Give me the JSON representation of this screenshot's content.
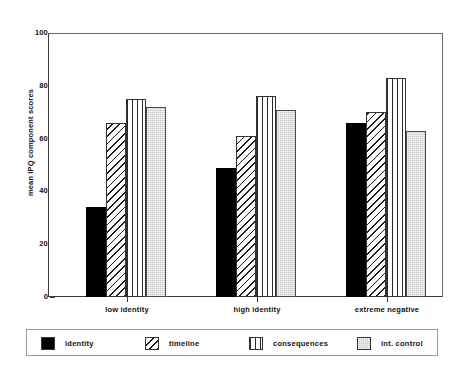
{
  "chart_data": {
    "type": "bar",
    "title": "",
    "xlabel": "",
    "ylabel": "mean IPQ component scores",
    "ylim": [
      0,
      100
    ],
    "yticks": [
      0,
      20,
      40,
      60,
      80,
      100
    ],
    "ytick_labels": [
      "0",
      "20",
      "40",
      "60",
      "80",
      "100"
    ],
    "grid": false,
    "legend_position": "bottom",
    "categories": [
      "low identity",
      "high identity",
      "extreme negative"
    ],
    "series": [
      {
        "name": "identity",
        "pattern": "solid-black",
        "color": "#000000",
        "values": [
          34,
          49,
          66
        ]
      },
      {
        "name": "timeline",
        "pattern": "diagonal-hatch",
        "color": "#ffffff",
        "values": [
          66,
          61,
          70
        ]
      },
      {
        "name": "consequences",
        "pattern": "vertical-lines",
        "color": "#ffffff",
        "values": [
          75,
          76,
          83
        ]
      },
      {
        "name": "int. control",
        "pattern": "light-gray-fill",
        "color": "#c9c9c9",
        "values": [
          72,
          71,
          63
        ]
      }
    ]
  },
  "axis": {
    "y_title": "mean IPQ component scores",
    "y_tick_labels": [
      "100",
      "80",
      "60",
      "40",
      "20",
      "0"
    ],
    "x_categories": [
      "low identity",
      "high identity",
      "extreme negative"
    ]
  },
  "legend": {
    "items": [
      {
        "label": "identity"
      },
      {
        "label": "timeline"
      },
      {
        "label": "consequences"
      },
      {
        "label": "int. control"
      }
    ]
  }
}
